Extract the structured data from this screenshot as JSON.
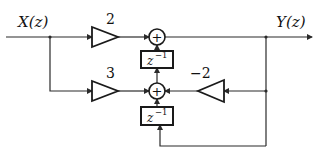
{
  "diagram": {
    "type": "signal-flow block diagram",
    "input_label": "X(z)",
    "output_label": "Y(z)",
    "gains": [
      {
        "id": "gain-top",
        "value": "2"
      },
      {
        "id": "gain-bottom",
        "value": "3"
      },
      {
        "id": "gain-feedback",
        "value": "−2"
      }
    ],
    "adders": [
      {
        "id": "adder-top",
        "symbol": "+"
      },
      {
        "id": "adder-bottom",
        "symbol": "+"
      }
    ],
    "delays": [
      {
        "id": "delay-top",
        "base": "z",
        "exponent": "−1"
      },
      {
        "id": "delay-bottom",
        "base": "z",
        "exponent": "−1"
      }
    ],
    "colors": {
      "line": "#2a2a2a",
      "background": "#ffffff"
    }
  }
}
